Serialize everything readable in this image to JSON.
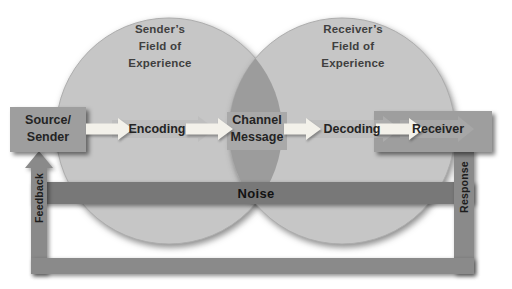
{
  "diagram": {
    "left_circle_label": "Sender’s\nField of\nExperience",
    "right_circle_label": "Receiver’s\nField of\nExperience",
    "flow": {
      "source": "Source/\nSender",
      "encoding": "Encoding",
      "channel": "Channel\nMessage",
      "decoding": "Decoding",
      "receiver": "Receiver"
    },
    "noise_label": "Noise",
    "feedback_label": "Feedback",
    "response_label": "Response"
  },
  "colors": {
    "background": "#ffffff",
    "circle": "#c6c6c6",
    "circle_edge": "#a8a8a8",
    "overlap": "#9c9c9c",
    "channel_box": "#a9a9a9",
    "endpoint_box": "#9e9e9e",
    "noise_bar": "#787878",
    "loop_bar": "#8a8a8a",
    "white_arrow": "#f3f1ea",
    "gray_arrow": "#b8b8b8",
    "heading_text": "#3f3f3f",
    "label_text": "#242424"
  }
}
